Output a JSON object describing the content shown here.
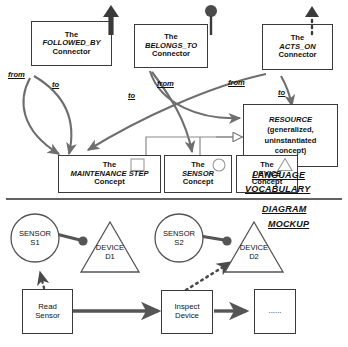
{
  "sections": {
    "vocabulary": "LANGUAGE\nVOCABULARY",
    "vocabulary_line1": "LANGUAGE",
    "vocabulary_line2": "VOCABULARY",
    "mockup_line1": "DIAGRAM",
    "mockup_line2": "MOCKUP"
  },
  "connectors": [
    {
      "id": "followed-by",
      "line1": "The",
      "line2": "FOLLOWED_BY",
      "line3": "Connector",
      "icon": "solid-arrow-up-icon",
      "from_label": "from",
      "to_label": "to"
    },
    {
      "id": "belongs-to",
      "line1": "The",
      "line2": "BELONGS_TO",
      "line3": "Connector",
      "icon": "pin-circle-icon",
      "from_label": "from",
      "to_label": "to"
    },
    {
      "id": "acts-on",
      "line1": "The",
      "line2": "ACTS_ON",
      "line3": "Connector",
      "icon": "dotted-arrow-up-icon",
      "from_label": "from",
      "to_label": "to"
    }
  ],
  "concepts": [
    {
      "id": "maintenance-step",
      "line1": "The",
      "line2": "MAINTENANCE  STEP",
      "line3": "Concept",
      "icon": "square-icon"
    },
    {
      "id": "sensor",
      "line1": "The",
      "line2": "SENSOR",
      "line3": "Concept",
      "icon": "circle-icon"
    },
    {
      "id": "device",
      "line1": "The",
      "line2": "DEVICE",
      "line3": "Concept",
      "icon": "triangle-icon"
    }
  ],
  "resource": {
    "line1": "RESOURCE",
    "line2": "(generalized,",
    "line3": "uninstantiated",
    "line4": "concept)"
  },
  "mockup": {
    "instances": [
      {
        "id": "sensor-s1",
        "shape": "circle",
        "line1": "SENSOR",
        "line2": "S1"
      },
      {
        "id": "device-d1",
        "shape": "triangle",
        "line1": "DEVICE",
        "line2": "D1"
      },
      {
        "id": "sensor-s2",
        "shape": "circle",
        "line1": "SENSOR",
        "line2": "S2"
      },
      {
        "id": "device-d2",
        "shape": "triangle",
        "line1": "DEVICE",
        "line2": "D2"
      }
    ],
    "steps": [
      {
        "id": "read-sensor",
        "line1": "Read",
        "line2": "Sensor"
      },
      {
        "id": "inspect-device",
        "line1": "Inspect",
        "line2": "Device"
      },
      {
        "id": "ellipsis-step",
        "line1": "......",
        "line2": ""
      }
    ]
  },
  "colors": {
    "stroke": "#3a3a3a",
    "edge": "#6e6e6e",
    "edge_dark": "#4a4a4a",
    "background": "#ffffff",
    "text": "#111111"
  }
}
